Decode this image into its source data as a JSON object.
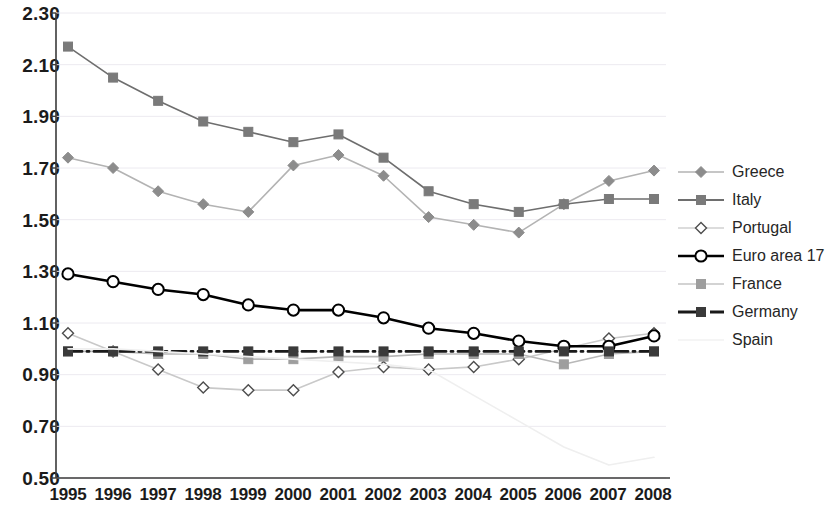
{
  "chart_data": {
    "type": "line",
    "title": "",
    "xlabel": "",
    "ylabel": "",
    "x": [
      1995,
      1996,
      1997,
      1998,
      1999,
      2000,
      2001,
      2002,
      2003,
      2004,
      2005,
      2006,
      2007,
      2008
    ],
    "categories": [
      "1995",
      "1996",
      "1997",
      "1998",
      "1999",
      "2000",
      "2001",
      "2002",
      "2003",
      "2004",
      "2005",
      "2006",
      "2007",
      "2008"
    ],
    "ylim": [
      0.5,
      2.3
    ],
    "yticks": [
      "0.50",
      "0.70",
      "0.90",
      "1.10",
      "1.30",
      "1.50",
      "1.70",
      "1.90",
      "2.10",
      "2.30"
    ],
    "ytick_values": [
      0.5,
      0.7,
      0.9,
      1.1,
      1.3,
      1.5,
      1.7,
      1.9,
      2.1,
      2.3
    ],
    "grid": true,
    "legend_position": "right",
    "series": [
      {
        "name": "Greece",
        "marker": "diamond",
        "color": "#8c8c8c",
        "line_color": "#b3b3b3",
        "values": [
          1.74,
          1.7,
          1.61,
          1.56,
          1.53,
          1.71,
          1.75,
          1.67,
          1.51,
          1.48,
          1.45,
          1.56,
          1.65,
          1.69
        ]
      },
      {
        "name": "Italy",
        "marker": "square",
        "color": "#7a7a7a",
        "line_color": "#6e6e6e",
        "values": [
          2.17,
          2.05,
          1.96,
          1.88,
          1.84,
          1.8,
          1.83,
          1.74,
          1.61,
          1.56,
          1.53,
          1.56,
          1.58,
          1.58
        ]
      },
      {
        "name": "Portugal",
        "marker": "open-diamond",
        "color": "#4d4d4d",
        "line_color": "#c9c9c9",
        "values": [
          1.06,
          0.99,
          0.92,
          0.85,
          0.84,
          0.84,
          0.91,
          0.93,
          0.92,
          0.93,
          0.96,
          1.0,
          1.04,
          1.06
        ]
      },
      {
        "name": "Euro area 17",
        "marker": "open-circle",
        "color": "#000000",
        "line_color": "#000000",
        "values": [
          1.29,
          1.26,
          1.23,
          1.21,
          1.17,
          1.15,
          1.15,
          1.12,
          1.08,
          1.06,
          1.03,
          1.01,
          1.01,
          1.05
        ]
      },
      {
        "name": "France",
        "marker": "square",
        "color": "#9e9e9e",
        "line_color": "#b8b8b8",
        "values": [
          0.99,
          0.99,
          0.98,
          0.98,
          0.96,
          0.96,
          0.97,
          0.97,
          0.98,
          0.98,
          0.98,
          0.94,
          0.98,
          0.99
        ]
      },
      {
        "name": "Germany",
        "marker": "filled-square",
        "color": "#3a3a3a",
        "line_color": "#1a1a1a",
        "values": [
          0.99,
          0.99,
          0.99,
          0.99,
          0.99,
          0.99,
          0.99,
          0.99,
          0.99,
          0.99,
          0.99,
          0.99,
          0.99,
          0.99
        ]
      },
      {
        "name": "Spain",
        "marker": "none",
        "color": "#ececec",
        "line_color": "#efefef",
        "values": [
          1.0,
          1.0,
          0.99,
          0.98,
          0.97,
          0.96,
          0.95,
          0.94,
          0.92,
          0.82,
          0.72,
          0.62,
          0.55,
          0.58
        ]
      }
    ]
  },
  "axis": {
    "y_labels": [
      "2.30",
      "2.10",
      "1.90",
      "1.70",
      "1.50",
      "1.30",
      "1.10",
      "0.90",
      "0.70",
      "0.50"
    ],
    "x_labels": [
      "1995",
      "1996",
      "1997",
      "1998",
      "1999",
      "2000",
      "2001",
      "2002",
      "2003",
      "2004",
      "2005",
      "2006",
      "2007",
      "2008"
    ]
  },
  "legend": {
    "items": [
      {
        "label": "Greece",
        "key": "greece-key"
      },
      {
        "label": "Italy",
        "key": "italy-key"
      },
      {
        "label": "Portugal",
        "key": "portugal-key"
      },
      {
        "label": "Euro area 17",
        "key": "euro-area-17-key"
      },
      {
        "label": "France",
        "key": "france-key"
      },
      {
        "label": "Germany",
        "key": "germany-key"
      },
      {
        "label": "Spain",
        "key": "spain-key"
      }
    ]
  }
}
